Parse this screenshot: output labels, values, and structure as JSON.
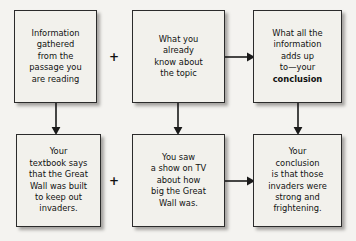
{
  "diagram": {
    "background_color": "#f4f3f0",
    "box_fill_color": "#f2f1ec",
    "box_border_color": "#2b2b2b",
    "text_color": "#111111",
    "boxes": [
      {
        "id": "information-gathered",
        "text": "Information\ngathered\nfrom the\npassage you\nare reading",
        "row": "top",
        "column": "left"
      },
      {
        "id": "what-you-already-know",
        "text": "What you\nalready\nknow about\nthe topic",
        "row": "top",
        "column": "middle"
      },
      {
        "id": "what-adds-up-to-conclusion",
        "text_before_bold": "What all the\ninformation\nadds up\nto—your\n",
        "text_bold": "conclusion",
        "row": "top",
        "column": "right"
      },
      {
        "id": "textbook-great-wall",
        "text": "Your\ntextbook says\nthat the Great\nWall was built\nto keep out\ninvaders.",
        "row": "bottom",
        "column": "left"
      },
      {
        "id": "tv-show-great-wall",
        "text": "You saw\na show on TV\nabout how\nbig the Great\nWall was.",
        "row": "bottom",
        "column": "middle"
      },
      {
        "id": "conclusion-invaders",
        "text": "Your\nconclusion\nis that those\ninvaders were\nstrong and\nfrightening.",
        "row": "bottom",
        "column": "right"
      }
    ],
    "operators": [
      {
        "id": "plus-top",
        "symbol": "+",
        "between": "information-gathered and what-you-already-know"
      },
      {
        "id": "plus-bottom",
        "symbol": "+",
        "between": "textbook-great-wall and tv-show-great-wall"
      }
    ],
    "connectors": [
      {
        "id": "arrow-known-to-concl",
        "direction": "right",
        "from": "what-you-already-know",
        "to": "what-adds-up-to-conclusion"
      },
      {
        "id": "arrow-tv-to-invaders",
        "direction": "right",
        "from": "tv-show-great-wall",
        "to": "conclusion-invaders"
      },
      {
        "id": "arrow-info-down",
        "direction": "down",
        "from": "information-gathered",
        "to": "textbook-great-wall"
      },
      {
        "id": "arrow-known-down",
        "direction": "down",
        "from": "what-you-already-know",
        "to": "tv-show-great-wall"
      },
      {
        "id": "arrow-concl-down",
        "direction": "down",
        "from": "what-adds-up-to-conclusion",
        "to": "conclusion-invaders"
      }
    ]
  }
}
